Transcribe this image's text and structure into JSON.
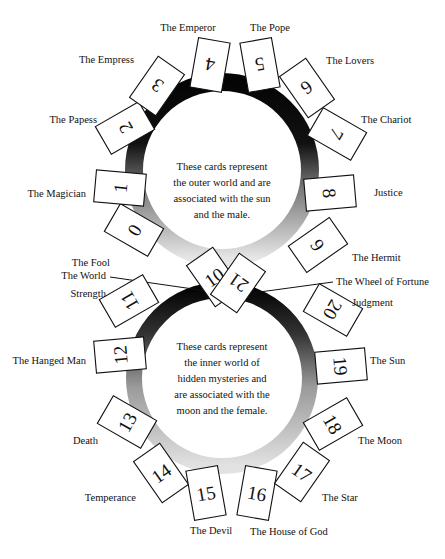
{
  "upper_description": [
    "These cards represent",
    "the outer world and are",
    "associated with the sun",
    "and the male."
  ],
  "lower_description": [
    "These cards represent",
    "the inner world of",
    "hidden mysteries and",
    "are associated with the",
    "moon and the female."
  ],
  "cards": [
    {
      "number": "0",
      "name": "The Fool",
      "cx": 134,
      "cy": 230,
      "rot": 120,
      "lx": 110,
      "ly": 266,
      "anchor": "end"
    },
    {
      "number": "1",
      "name": "The Magician",
      "cx": 120,
      "cy": 188,
      "rot": 95,
      "lx": 86,
      "ly": 197,
      "anchor": "end"
    },
    {
      "number": "2",
      "name": "The Papess",
      "cx": 125,
      "cy": 128,
      "rot": 60,
      "lx": 97,
      "ly": 123,
      "anchor": "end"
    },
    {
      "number": "3",
      "name": "The Empress",
      "cx": 157,
      "cy": 86,
      "rot": 35,
      "lx": 134,
      "ly": 63,
      "anchor": "end"
    },
    {
      "number": "4",
      "name": "The Emperor",
      "cx": 210,
      "cy": 65,
      "rot": 10,
      "lx": 188,
      "ly": 31,
      "anchor": "middle"
    },
    {
      "number": "5",
      "name": "The Pope",
      "cx": 260,
      "cy": 65,
      "rot": -10,
      "lx": 270,
      "ly": 31,
      "anchor": "middle"
    },
    {
      "number": "6",
      "name": "The Lovers",
      "cx": 307,
      "cy": 88,
      "rot": -35,
      "lx": 326,
      "ly": 64,
      "anchor": "start"
    },
    {
      "number": "7",
      "name": "The Chariot",
      "cx": 337,
      "cy": 134,
      "rot": -60,
      "lx": 361,
      "ly": 123,
      "anchor": "start"
    },
    {
      "number": "8",
      "name": "Justice",
      "cx": 330,
      "cy": 193,
      "rot": -95,
      "lx": 374,
      "ly": 196,
      "anchor": "start"
    },
    {
      "number": "9",
      "name": "The Hermit",
      "cx": 318,
      "cy": 245,
      "rot": -125,
      "lx": 352,
      "ly": 261,
      "anchor": "start"
    },
    {
      "number": "10",
      "name": "The Wheel of Fortune",
      "cx": 214,
      "cy": 277,
      "rot": 145,
      "lx": 336,
      "ly": 285,
      "anchor": "start"
    },
    {
      "number": "11",
      "name": "Strength",
      "cx": 129,
      "cy": 301,
      "rot": 60,
      "lx": 106,
      "ly": 297,
      "anchor": "end"
    },
    {
      "number": "12",
      "name": "The Hanged Man",
      "cx": 120,
      "cy": 355,
      "rot": 85,
      "lx": 86,
      "ly": 364,
      "anchor": "end"
    },
    {
      "number": "13",
      "name": "Death",
      "cx": 127,
      "cy": 422,
      "rot": 120,
      "lx": 98,
      "ly": 444,
      "anchor": "end"
    },
    {
      "number": "14",
      "name": "Temperance",
      "cx": 161,
      "cy": 473,
      "rot": 145,
      "lx": 136,
      "ly": 501,
      "anchor": "end"
    },
    {
      "number": "15",
      "name": "The Devil",
      "cx": 206,
      "cy": 493,
      "rot": 170,
      "lx": 190,
      "ly": 534,
      "anchor": "start"
    },
    {
      "number": "16",
      "name": "The House of God",
      "cx": 257,
      "cy": 493,
      "rot": -170,
      "lx": 250,
      "ly": 535,
      "anchor": "start"
    },
    {
      "number": "17",
      "name": "The Star",
      "cx": 302,
      "cy": 472,
      "rot": -145,
      "lx": 322,
      "ly": 501,
      "anchor": "start"
    },
    {
      "number": "18",
      "name": "The Moon",
      "cx": 333,
      "cy": 424,
      "rot": -120,
      "lx": 358,
      "ly": 444,
      "anchor": "start"
    },
    {
      "number": "19",
      "name": "The Sun",
      "cx": 341,
      "cy": 366,
      "rot": -95,
      "lx": 370,
      "ly": 364,
      "anchor": "start"
    },
    {
      "number": "20",
      "name": "Judgment",
      "cx": 333,
      "cy": 310,
      "rot": -60,
      "lx": 352,
      "ly": 306,
      "anchor": "start"
    },
    {
      "number": "21",
      "name": "The World",
      "cx": 238,
      "cy": 283,
      "rot": 35,
      "lx": 106,
      "ly": 279,
      "anchor": "end"
    }
  ],
  "connectors": [
    {
      "from": "The World",
      "x1": 110,
      "y1": 277,
      "x2": 228,
      "y2": 294
    },
    {
      "from": "The Wheel of Fortune",
      "x1": 333,
      "y1": 282,
      "x2": 245,
      "y2": 294
    }
  ],
  "colors": {
    "ring_dark": "#0a0a0a",
    "ring_light": "#d8d8d8",
    "card_stroke": "#111111",
    "text": "#111111"
  }
}
